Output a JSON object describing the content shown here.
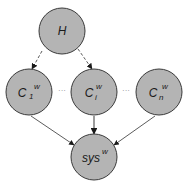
{
  "diagram": {
    "type": "directed-graph",
    "colors": {
      "node_fill": "#b4b4b4",
      "node_stroke": "#3a3a3a",
      "edge": "#3a3a3a",
      "background": "#ffffff"
    },
    "nodes": [
      {
        "id": "H",
        "base": "H",
        "sub": "",
        "sup": ""
      },
      {
        "id": "C1w",
        "base": "C",
        "sub": "1",
        "sup": "w"
      },
      {
        "id": "Ciw",
        "base": "C",
        "sub": "i",
        "sup": "w"
      },
      {
        "id": "Cnw",
        "base": "C",
        "sub": "n",
        "sup": "w"
      },
      {
        "id": "sysw",
        "base": "sys",
        "sub": "",
        "sup": "w"
      }
    ],
    "edges": [
      {
        "from": "H",
        "to": "C1w",
        "style": "dashed"
      },
      {
        "from": "H",
        "to": "Ciw",
        "style": "dashed"
      },
      {
        "from": "C1w",
        "to": "sysw",
        "style": "solid"
      },
      {
        "from": "Ciw",
        "to": "sysw",
        "style": "solid"
      },
      {
        "from": "Cnw",
        "to": "sysw",
        "style": "solid"
      }
    ],
    "ellipses": [
      {
        "between": [
          "C1w",
          "Ciw"
        ],
        "text": "···"
      },
      {
        "between": [
          "Ciw",
          "Cnw"
        ],
        "text": "···"
      }
    ]
  }
}
